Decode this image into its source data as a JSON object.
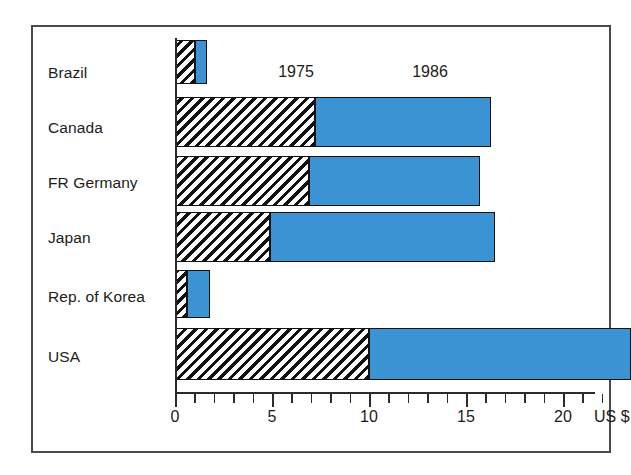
{
  "chart_data": {
    "type": "bar",
    "orientation": "horizontal",
    "stacked": true,
    "title": "",
    "subtitle": "",
    "xlabel": "US $",
    "ylabel": "",
    "xlim": [
      0,
      24
    ],
    "grid": false,
    "legend_position": "inline-above-bars",
    "categories": [
      "Brazil",
      "Canada",
      "FR Germany",
      "Japan",
      "Rep. of Korea",
      "USA"
    ],
    "series": [
      {
        "name": "1975",
        "style": "black-diagonal-hatch",
        "values": [
          1.05,
          7.2,
          6.9,
          4.9,
          0.6,
          10.0
        ]
      },
      {
        "name": "1986",
        "style": "solid-blue",
        "color": "#3b93d4",
        "values": [
          1.65,
          16.3,
          15.7,
          16.5,
          1.8,
          23.5
        ]
      }
    ],
    "axis": {
      "tick_labels": [
        "0",
        "5",
        "10",
        "15",
        "20"
      ],
      "tick_values": [
        0,
        5,
        10,
        15,
        20
      ],
      "minor_tick_step": 1,
      "unit_label": "US $"
    },
    "annotations": [
      {
        "text": "1975",
        "x": 6.05,
        "y_row": "above-canada"
      },
      {
        "text": "1986",
        "x": 12.75,
        "y_row": "above-canada"
      }
    ]
  },
  "colors": {
    "bar_1986": "#3b93d4",
    "bar_outline": "#111111",
    "axis": "#2b2b2b",
    "frame": "#4a4a4a",
    "text": "#1b1b1b",
    "background": "#ffffff"
  },
  "labels": {
    "categories": {
      "brazil": "Brazil",
      "canada": "Canada",
      "fr_germany": "FR Germany",
      "japan": "Japan",
      "korea": "Rep. of Korea",
      "usa": "USA"
    },
    "series": {
      "s1975": "1975",
      "s1986": "1986"
    },
    "ticks": {
      "t0": "0",
      "t5": "5",
      "t10": "10",
      "t15": "15",
      "t20": "20",
      "unit": "US $"
    }
  }
}
